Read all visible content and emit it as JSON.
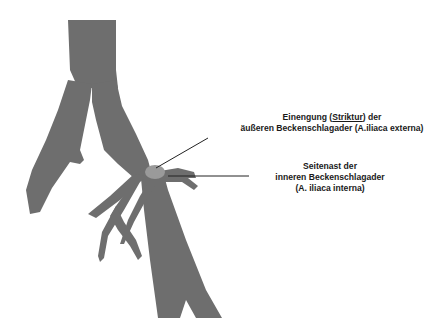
{
  "figure": {
    "vessel_color": "#6e6e6e",
    "stenosis_color": "#9a9a9a",
    "line_color": "#222222"
  },
  "annotations": [
    {
      "id": "stricture",
      "line1_before": "Einengung (",
      "line1_underlined": "Striktur",
      "line1_after": ") der",
      "line2": "äußeren Beckenschlagader (A.iliaca externa)",
      "pointer": {
        "x1": 156,
        "y1": 168,
        "x2": 208,
        "y2": 138
      }
    },
    {
      "id": "side-branch",
      "line1": "Seitenast der",
      "line2": "inneren Beckenschlagader",
      "line3": "(A. iliaca interna)",
      "pointer": {
        "x1": 168,
        "y1": 176,
        "x2": 249,
        "y2": 176
      }
    }
  ]
}
